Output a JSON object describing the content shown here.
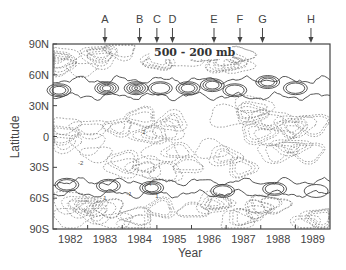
{
  "chart_data": {
    "type": "heatmap",
    "subtype": "contour",
    "title": "",
    "annotation": "500 - 200 mb",
    "xlabel": "Year",
    "ylabel": "Latitude",
    "xlim": [
      1981.5,
      1989.5
    ],
    "ylim": [
      -90,
      90
    ],
    "x_ticks": [
      1982,
      1983,
      1984,
      1985,
      1986,
      1987,
      1988,
      1989
    ],
    "x_tick_labels": [
      "1982",
      "1983",
      "1984",
      "1985",
      "1986",
      "1987",
      "1988",
      "1989"
    ],
    "y_ticks": [
      90,
      60,
      30,
      0,
      -30,
      -60,
      -90
    ],
    "y_tick_labels": [
      "90N",
      "60N",
      "30N",
      "0",
      "30S",
      "60S",
      "90S"
    ],
    "grid": false,
    "event_markers": [
      {
        "label": "A",
        "x": 1983.0
      },
      {
        "label": "B",
        "x": 1984.0
      },
      {
        "label": "C",
        "x": 1984.5
      },
      {
        "label": "D",
        "x": 1984.95
      },
      {
        "label": "E",
        "x": 1986.15
      },
      {
        "label": "F",
        "x": 1986.9
      },
      {
        "label": "G",
        "x": 1987.55
      },
      {
        "label": "H",
        "x": 1988.95
      }
    ],
    "contour_styles": {
      "positive": "solid",
      "negative": "dashed"
    },
    "features": [
      {
        "name": "northern-positive-band",
        "sign": "positive",
        "lat_center": 47,
        "lat_halfwidth": 8,
        "x_start": 1981.5,
        "x_end": 1989.5
      },
      {
        "name": "southern-positive-band",
        "sign": "positive",
        "lat_center": -50,
        "lat_halfwidth": 6,
        "x_start": 1981.5,
        "x_end": 1989.5
      }
    ],
    "positive_cores": [
      {
        "x": 1981.65,
        "lat": 45,
        "levels": 3
      },
      {
        "x": 1983.05,
        "lat": 47,
        "levels": 4
      },
      {
        "x": 1983.9,
        "lat": 47,
        "levels": 5
      },
      {
        "x": 1984.6,
        "lat": 47,
        "levels": 2
      },
      {
        "x": 1985.4,
        "lat": 47,
        "levels": 3
      },
      {
        "x": 1986.1,
        "lat": 50,
        "levels": 3
      },
      {
        "x": 1986.75,
        "lat": 45,
        "levels": 2
      },
      {
        "x": 1987.7,
        "lat": 53,
        "levels": 3
      },
      {
        "x": 1988.5,
        "lat": 47,
        "levels": 2
      },
      {
        "x": 1981.9,
        "lat": -47,
        "levels": 2
      },
      {
        "x": 1983.1,
        "lat": -48,
        "levels": 2
      },
      {
        "x": 1984.35,
        "lat": -50,
        "levels": 3
      },
      {
        "x": 1986.4,
        "lat": -53,
        "levels": 2
      },
      {
        "x": 1987.9,
        "lat": -51,
        "levels": 2
      },
      {
        "x": 1989.1,
        "lat": -53,
        "levels": 1
      }
    ],
    "contour_value_labels": [
      {
        "x": 1982.3,
        "lat": -28,
        "text": "-2"
      },
      {
        "x": 1984.1,
        "lat": 2,
        "text": "-2"
      },
      {
        "x": 1983.7,
        "lat": -58,
        "text": "-1"
      },
      {
        "x": 1984.3,
        "lat": -48,
        "text": "4"
      },
      {
        "x": 1984.5,
        "lat": -60,
        "text": "1"
      },
      {
        "x": 1983.0,
        "lat": -62,
        "text": "1"
      }
    ]
  }
}
